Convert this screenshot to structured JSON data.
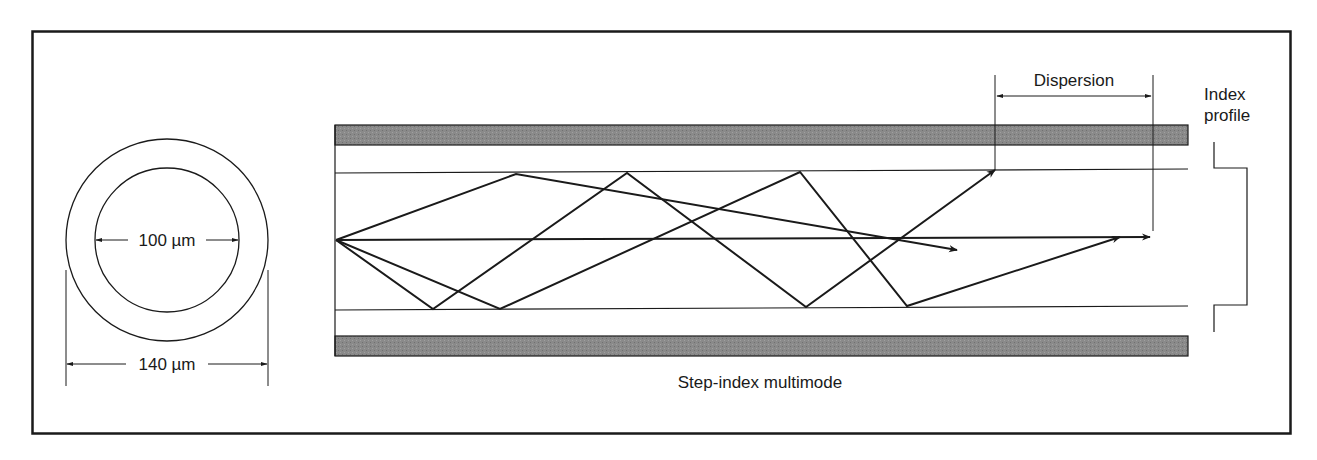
{
  "figure": {
    "caption": "Step-index multimode",
    "frame_color": "#1a1a1a",
    "line_color": "#1a1a1a",
    "cladding_band_color": "#8a8a8a"
  },
  "cross_section": {
    "core_diameter_label": "100 µm",
    "cladding_diameter_label": "140 µm",
    "core_diameter_um": 100,
    "cladding_diameter_um": 140
  },
  "fiber_side_view": {
    "dispersion_label": "Dispersion",
    "index_profile_label_line1": "Index",
    "index_profile_label_line2": "profile",
    "rays": [
      {
        "name": "axial-ray",
        "points": [
          [
            336,
            240
          ],
          [
            1150,
            237
          ]
        ]
      },
      {
        "name": "ray-a",
        "points": [
          [
            336,
            240
          ],
          [
            516,
            174
          ],
          [
            957,
            250
          ]
        ]
      },
      {
        "name": "ray-b",
        "points": [
          [
            336,
            240
          ],
          [
            433,
            309
          ],
          [
            627,
            173
          ],
          [
            806,
            307
          ],
          [
            995,
            170
          ]
        ]
      },
      {
        "name": "ray-c",
        "points": [
          [
            336,
            240
          ],
          [
            500,
            309
          ],
          [
            800,
            172
          ],
          [
            907,
            306
          ],
          [
            1120,
            237
          ]
        ]
      }
    ]
  }
}
